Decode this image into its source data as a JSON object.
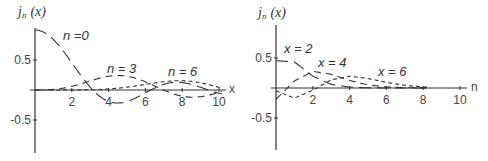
{
  "chart_data": [
    {
      "type": "line",
      "title": "",
      "ylabel": "j_n (x)",
      "ylabel_main": "j",
      "ylabel_sub": "n",
      "ylabel_arg": "(x)",
      "xlabel": "x",
      "xlim": [
        0,
        10.5
      ],
      "ylim": [
        -1,
        1
      ],
      "xticks": [
        2,
        4,
        6,
        8,
        10
      ],
      "xtick_labels": [
        "2",
        "4",
        "6",
        "8",
        "10"
      ],
      "yticks": [
        0.5,
        -0.5
      ],
      "ytick_labels": [
        "0.5",
        "-0.5"
      ],
      "grid": false,
      "variable": "x",
      "series": [
        {
          "name": "n = 0",
          "order": 0,
          "label": "n =0",
          "dash": "long"
        },
        {
          "name": "n = 3",
          "order": 3,
          "label": "n = 3",
          "dash": "medium"
        },
        {
          "name": "n = 6",
          "order": 6,
          "label": "n = 6",
          "dash": "short"
        }
      ],
      "annotations": [
        "n =0",
        "n = 3",
        "n = 6"
      ]
    },
    {
      "type": "line",
      "title": "",
      "ylabel": "j_n (x)",
      "ylabel_main": "j",
      "ylabel_sub": "n",
      "ylabel_arg": "(x)",
      "xlabel": "n",
      "xlim": [
        0,
        10.5
      ],
      "ylim": [
        -1,
        1
      ],
      "xticks": [
        2,
        4,
        6,
        8,
        10
      ],
      "xtick_labels": [
        "2",
        "4",
        "6",
        "8",
        "10"
      ],
      "yticks": [
        0.5,
        -0.5
      ],
      "ytick_labels": [
        "0.5",
        "-0.5"
      ],
      "grid": false,
      "variable": "n",
      "series": [
        {
          "name": "x = 2",
          "x": 2,
          "label": "x = 2",
          "dash": "long"
        },
        {
          "name": "x = 4",
          "x": 4,
          "label": "x = 4",
          "dash": "medium"
        },
        {
          "name": "x = 6",
          "x": 6,
          "label": "x = 6",
          "dash": "short"
        }
      ],
      "annotations": [
        "x = 2",
        "x = 4",
        "x = 6"
      ]
    }
  ]
}
